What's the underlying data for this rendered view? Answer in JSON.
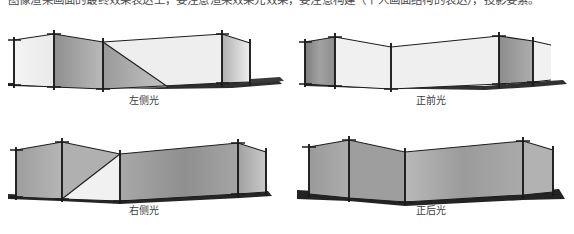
{
  "header": {
    "clipped_line": "图像渲染画面的最终效果表达上，要注意渲染效果光效果，要注意构建（个人画面结构的表达），投影要素。"
  },
  "figure": {
    "panels": [
      {
        "id": "left-side-light",
        "caption": "左侧光",
        "row": 0,
        "col": 0,
        "description": "Fence structure lit from the left side; left faces bright, angled returns in mid gray",
        "tones": {
          "bright": "#f2f2f2",
          "mid": "#a9a9a9",
          "dark": "#8c8c8c",
          "ground": "#2f2f2f",
          "post": "#1c1c1c"
        }
      },
      {
        "id": "front-light",
        "caption": "正前光",
        "row": 0,
        "col": 1,
        "description": "Fence structure lit from the front; center panels bright, end returns dark",
        "tones": {
          "bright": "#f2f2f2",
          "mid": "#b4b4b4",
          "dark": "#8a8a8a",
          "ground": "#2f2f2f",
          "post": "#1c1c1c"
        }
      },
      {
        "id": "right-side-light",
        "caption": "右侧光",
        "row": 1,
        "col": 0,
        "description": "Fence structure lit from the right side; broad center panel mid gray, small bright wedge at left",
        "tones": {
          "bright": "#f2f2f2",
          "mid": "#a3a3a3",
          "dark": "#8e8e8e",
          "ground": "#262626",
          "post": "#1c1c1c"
        }
      },
      {
        "id": "back-light",
        "caption": "正后光",
        "row": 1,
        "col": 1,
        "description": "Fence structure lit from behind; all panels uniformly mid gray, heavy dark ground shadow",
        "tones": {
          "bright": "#c8c8c8",
          "mid": "#a0a0a0",
          "dark": "#949494",
          "ground": "#232323",
          "post": "#1c1c1c"
        }
      }
    ]
  },
  "colors": {
    "page_background": "#ffffff",
    "caption_text": "#3c3c3c",
    "header_text": "#4a4a4a",
    "post_stroke": "#1c1c1c",
    "ground_shadow": "#2b2b2b"
  }
}
